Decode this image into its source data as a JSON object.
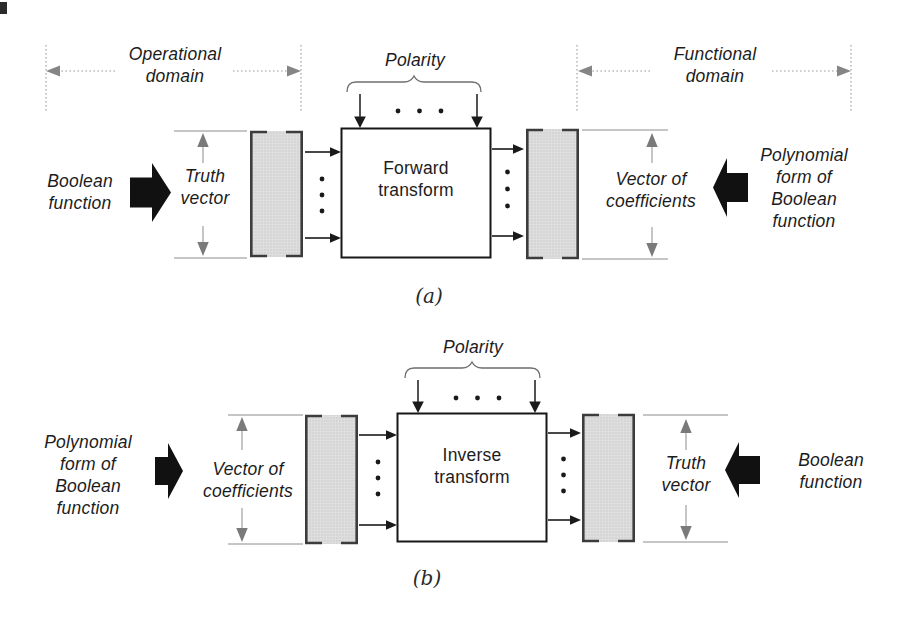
{
  "figure": {
    "diagram_a": {
      "caption": "(a)",
      "domain_left_label": "Operational\ndomain",
      "polarity_label": "Polarity",
      "domain_right_label": "Functional\ndomain",
      "input_label": "Boolean\nfunction",
      "input_vector_label": "Truth\nvector",
      "transform_label": "Forward\ntransform",
      "output_vector_label": "Vector of\ncoefficients",
      "output_label": "Polynomial\nform of\nBoolean\nfunction"
    },
    "diagram_b": {
      "caption": "(b)",
      "polarity_label": "Polarity",
      "input_label": "Polynomial\nform of\nBoolean\nfunction",
      "input_vector_label": "Vector of\ncoefficients",
      "transform_label": "Inverse\ntransform",
      "output_vector_label": "Truth\nvector",
      "output_label": "Boolean\nfunction"
    },
    "colors": {
      "ink": "#1a1a1a",
      "measure_gray": "#8c8c8c",
      "dashed_gray": "#9a9a9a",
      "bar_fill": "#d9d9d9",
      "bracket_dark": "#3c3c3c"
    }
  }
}
